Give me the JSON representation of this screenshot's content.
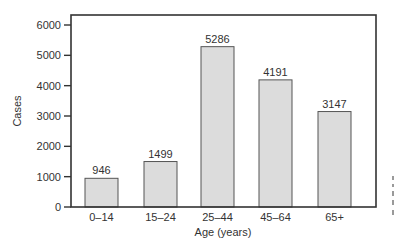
{
  "chart_data": {
    "type": "bar",
    "title": "",
    "xlabel": "Age (years)",
    "ylabel": "Cases",
    "categories": [
      "0–14",
      "15–24",
      "25–44",
      "45–64",
      "65+"
    ],
    "values": [
      946,
      1499,
      5286,
      4191,
      3147
    ],
    "data_labels": [
      "946",
      "1499",
      "5286",
      "4191",
      "3147"
    ],
    "ylim": [
      0,
      6000
    ],
    "yticks": [
      0,
      1000,
      2000,
      3000,
      4000,
      5000,
      6000
    ],
    "ytick_labels": [
      "0",
      "1000",
      "2000",
      "3000",
      "4000",
      "5000",
      "6000"
    ],
    "grid": false,
    "legend": null,
    "colors": {
      "bar_fill": "#dcdcdc",
      "bar_edge": "#555555",
      "axis": "#333333"
    }
  }
}
